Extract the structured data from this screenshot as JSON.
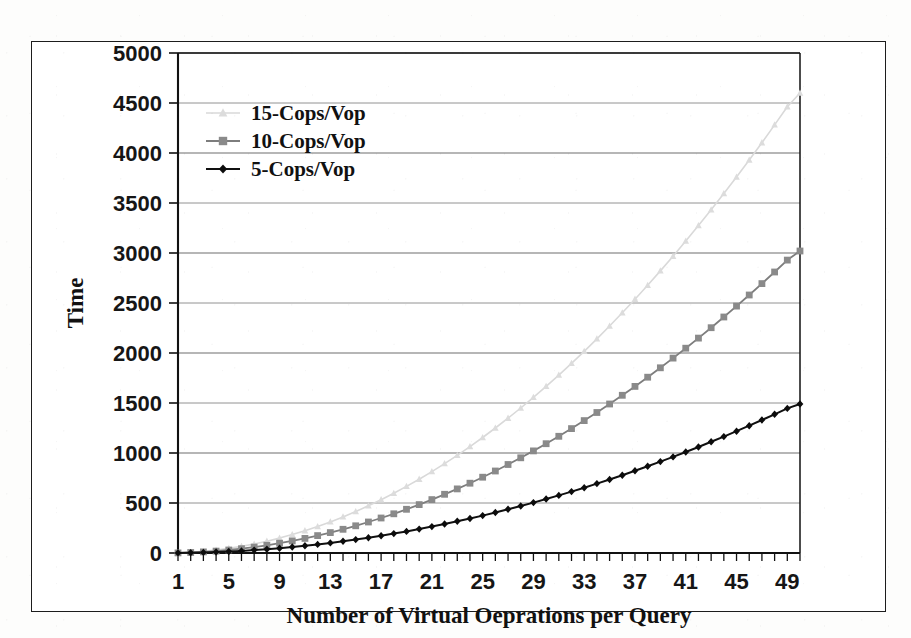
{
  "figure": {
    "name": "performance-line-chart",
    "background_color": "#ffffff",
    "frame_color": "#1c1c1c"
  },
  "chart_data": {
    "type": "line",
    "title": "",
    "xlabel": "Number of Virtual Oeprations per Query",
    "ylabel": "Time",
    "xlim": [
      1,
      50
    ],
    "ylim": [
      0,
      5000
    ],
    "grid": true,
    "grid_axis": "y",
    "legend_position": "upper-left-inside",
    "x_tick_step": 1,
    "x_label_step": 4,
    "y_tick_step": 500,
    "xticklabels": [
      "1",
      "5",
      "9",
      "13",
      "17",
      "21",
      "25",
      "29",
      "33",
      "37",
      "41",
      "45",
      "49"
    ],
    "xtickvalues": [
      1,
      5,
      9,
      13,
      17,
      21,
      25,
      29,
      33,
      37,
      41,
      45,
      49
    ],
    "yticklabels": [
      "0",
      "500",
      "1000",
      "1500",
      "2000",
      "2500",
      "3000",
      "3500",
      "4000",
      "4500",
      "5000"
    ],
    "ytickvalues": [
      0,
      500,
      1000,
      1500,
      2000,
      2500,
      3000,
      3500,
      4000,
      4500,
      5000
    ],
    "x": [
      1,
      2,
      3,
      4,
      5,
      6,
      7,
      8,
      9,
      10,
      11,
      12,
      13,
      14,
      15,
      16,
      17,
      18,
      19,
      20,
      21,
      22,
      23,
      24,
      25,
      26,
      27,
      28,
      29,
      30,
      31,
      32,
      33,
      34,
      35,
      36,
      37,
      38,
      39,
      40,
      41,
      42,
      43,
      44,
      45,
      46,
      47,
      48,
      49,
      50
    ],
    "series": [
      {
        "name": "15-Cops/Vop",
        "color": "#d9d9d9",
        "marker": "triangle",
        "marker_color": "#dcdcdc",
        "line_width": 1.6,
        "values": [
          2,
          7,
          17,
          29,
          46,
          66,
          90,
          118,
          149,
          184,
          223,
          265,
          311,
          361,
          414,
          472,
          533,
          597,
          666,
          738,
          814,
          894,
          977,
          1064,
          1155,
          1250,
          1348,
          1450,
          1556,
          1666,
          1779,
          1896,
          2017,
          2141,
          2270,
          2402,
          2538,
          2677,
          2821,
          2968,
          3119,
          3274,
          3432,
          3594,
          3760,
          3930,
          4103,
          4281,
          4462,
          4600
        ]
      },
      {
        "name": "10-Cops/Vop",
        "color": "#7d7d7d",
        "marker": "square",
        "marker_color": "#8a8a8a",
        "line_width": 1.8,
        "values": [
          1,
          5,
          11,
          19,
          30,
          43,
          59,
          77,
          98,
          121,
          146,
          174,
          204,
          237,
          272,
          310,
          350,
          392,
          437,
          484,
          534,
          587,
          641,
          698,
          758,
          820,
          885,
          952,
          1021,
          1093,
          1167,
          1244,
          1324,
          1405,
          1490,
          1577,
          1666,
          1758,
          1852,
          1949,
          2048,
          2149,
          2253,
          2360,
          2469,
          2580,
          2694,
          2810,
          2929,
          3020
        ]
      },
      {
        "name": "5-Cops/Vop",
        "color": "#101010",
        "marker": "diamond",
        "marker_color": "#0c0c0c",
        "line_width": 2.0,
        "values": [
          1,
          3,
          6,
          10,
          15,
          21,
          29,
          38,
          48,
          60,
          72,
          86,
          101,
          117,
          134,
          153,
          173,
          194,
          216,
          239,
          264,
          290,
          317,
          345,
          374,
          405,
          437,
          470,
          504,
          540,
          576,
          614,
          653,
          694,
          735,
          778,
          822,
          867,
          914,
          961,
          1010,
          1060,
          1112,
          1164,
          1218,
          1273,
          1330,
          1387,
          1446,
          1490
        ]
      }
    ]
  },
  "legend": {
    "entries": [
      {
        "label": "15-Cops/Vop",
        "swatch": "triangle-marker",
        "color": "#dcdcdc"
      },
      {
        "label": "10-Cops/Vop",
        "swatch": "square-marker",
        "color": "#8a8a8a"
      },
      {
        "label": "5-Cops/Vop",
        "swatch": "diamond-marker",
        "color": "#0c0c0c"
      }
    ]
  }
}
